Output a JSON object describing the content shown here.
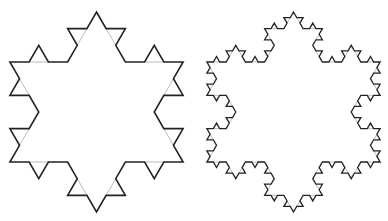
{
  "figure": {
    "background": "#ffffff",
    "stroke_color": "#222222",
    "guide_color": "#aaaaaa",
    "snowflakes": [
      {
        "name": "koch-snowflake-iteration-2",
        "cx": 96.5,
        "cy": 112,
        "radius": 100,
        "iterations": 2
      },
      {
        "name": "koch-snowflake-iteration-3",
        "cx": 293.5,
        "cy": 112,
        "radius": 100,
        "iterations": 3
      }
    ]
  }
}
